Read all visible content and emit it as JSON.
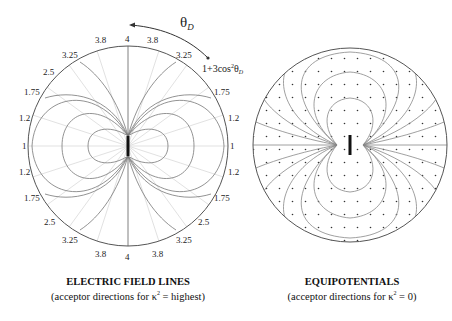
{
  "left_panel": {
    "title": "ELECTRIC FIELD LINES",
    "subtitle_pre": "(acceptor directions for κ",
    "subtitle_sup": "2",
    "subtitle_post": " = highest)",
    "angle_label": "θ",
    "angle_sub": "D",
    "formula_pre": "1+3cos",
    "formula_sup": "2",
    "formula_theta": "θ",
    "formula_sub": "D",
    "rim_labels_top": [
      "1",
      "1.2",
      "1.75",
      "2.5",
      "3.25",
      "3.8",
      "4",
      "3.8",
      "3.25",
      "1.75",
      "1.2",
      "1"
    ],
    "rim_labels_bottom": [
      "1.2",
      "1.75",
      "2.5",
      "3.25",
      "3.8",
      "4",
      "3.8",
      "3.25",
      "2.5",
      "1.75",
      "1.2"
    ]
  },
  "right_panel": {
    "title": "EQUIPOTENTIALS",
    "subtitle_pre": "(acceptor directions for κ",
    "subtitle_sup": "2",
    "subtitle_post": " = 0)"
  },
  "labels": {
    "t_4": "4",
    "t_38": "3.8",
    "t_325": "3.25",
    "t_25": "2.5",
    "t_175": "1.75",
    "t_12": "1.2",
    "t_1": "1"
  }
}
